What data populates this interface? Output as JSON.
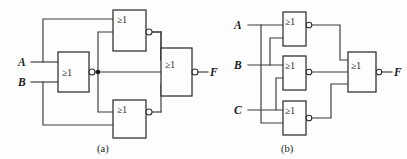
{
  "figure": {
    "background": "#fdfdfd",
    "line_color": "#3a3a3a",
    "text_color": "#1c1c1c",
    "gate_symbol": "≥1"
  },
  "diagram_a": {
    "caption": "(a)",
    "inputs": [
      {
        "label": "A"
      },
      {
        "label": "B"
      }
    ],
    "outputs": [
      {
        "label": "F"
      }
    ],
    "gates": [
      {
        "id": "a-g1",
        "symbol": "≥1",
        "role": "input-nor"
      },
      {
        "id": "a-g2",
        "symbol": "≥1",
        "role": "upper-nor"
      },
      {
        "id": "a-g3",
        "symbol": "≥1",
        "role": "lower-nor"
      },
      {
        "id": "a-g4",
        "symbol": "≥1",
        "role": "output-nor"
      }
    ]
  },
  "diagram_b": {
    "caption": "(b)",
    "inputs": [
      {
        "label": "A"
      },
      {
        "label": "B"
      },
      {
        "label": "C"
      }
    ],
    "outputs": [
      {
        "label": "F"
      }
    ],
    "gates": [
      {
        "id": "b-g1",
        "symbol": "≥1",
        "role": "top-nor"
      },
      {
        "id": "b-g2",
        "symbol": "≥1",
        "role": "middle-nor"
      },
      {
        "id": "b-g3",
        "symbol": "≥1",
        "role": "bottom-nor"
      },
      {
        "id": "b-g4",
        "symbol": "≥1",
        "role": "output-nor"
      }
    ]
  }
}
